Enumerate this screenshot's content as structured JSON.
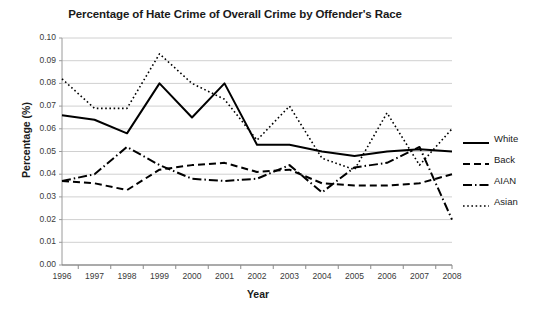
{
  "chart_data": {
    "type": "line",
    "title": "Percentage of Hate Crime of Overall Crime by Offender's Race",
    "xlabel": "Year",
    "ylabel": "Percentage (%)",
    "categories": [
      "1996",
      "1997",
      "1998",
      "1999",
      "2000",
      "2001",
      "2002",
      "2003",
      "2004",
      "2005",
      "2006",
      "2007",
      "2008"
    ],
    "x": [
      1996,
      1997,
      1998,
      1999,
      2000,
      2001,
      2002,
      2003,
      2004,
      2005,
      2006,
      2007,
      2008
    ],
    "ylim": [
      0.0,
      0.1
    ],
    "yticks": [
      "0.00",
      "0.01",
      "0.02",
      "0.03",
      "0.04",
      "0.05",
      "0.06",
      "0.07",
      "0.08",
      "0.09",
      "0.10"
    ],
    "ytick_values": [
      0.0,
      0.01,
      0.02,
      0.03,
      0.04,
      0.05,
      0.06,
      0.07,
      0.08,
      0.09,
      0.1
    ],
    "grid": "horizontal",
    "legend_position": "right",
    "series": [
      {
        "name": "White",
        "style": "solid",
        "color": "#000000",
        "values": [
          0.066,
          0.064,
          0.058,
          0.08,
          0.065,
          0.08,
          0.053,
          0.053,
          0.05,
          0.048,
          0.05,
          0.051,
          0.05
        ]
      },
      {
        "name": "Back",
        "style": "dashed",
        "color": "#000000",
        "values": [
          0.037,
          0.036,
          0.033,
          0.042,
          0.044,
          0.045,
          0.041,
          0.042,
          0.036,
          0.035,
          0.035,
          0.036,
          0.04
        ]
      },
      {
        "name": "AIAN",
        "style": "dashdot",
        "color": "#000000",
        "values": [
          0.037,
          0.04,
          0.052,
          0.044,
          0.038,
          0.037,
          0.038,
          0.044,
          0.032,
          0.043,
          0.045,
          0.052,
          0.02
        ]
      },
      {
        "name": "Asian",
        "style": "dotted",
        "color": "#000000",
        "values": [
          0.082,
          0.069,
          0.069,
          0.093,
          0.08,
          0.073,
          0.055,
          0.07,
          0.047,
          0.042,
          0.067,
          0.044,
          0.06
        ]
      }
    ]
  },
  "legend": {
    "items": [
      {
        "label": "White"
      },
      {
        "label": "Back"
      },
      {
        "label": "AIAN"
      },
      {
        "label": "Asian"
      }
    ]
  },
  "colors": {
    "line": "#000000",
    "grid": "#d0d0d0",
    "axis": "#9a9a9a",
    "text": "#1a1a1a"
  }
}
